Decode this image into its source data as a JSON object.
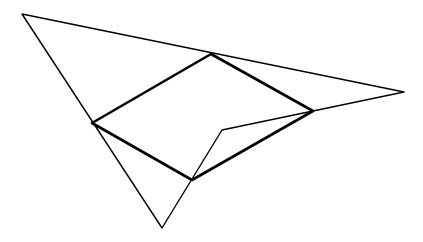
{
  "diagram": {
    "width": 423,
    "height": 242,
    "stroke_color": "#000000",
    "background": "#ffffff",
    "outer_shape": {
      "label": "",
      "points": [
        [
          22,
          14
        ],
        [
          404,
          92
        ],
        [
          222,
          130
        ],
        [
          162,
          228
        ]
      ]
    },
    "inner_quadrilateral": {
      "label": "",
      "points": [
        [
          92,
          123
        ],
        [
          211,
          54
        ],
        [
          313,
          111
        ],
        [
          192,
          180
        ]
      ]
    }
  }
}
